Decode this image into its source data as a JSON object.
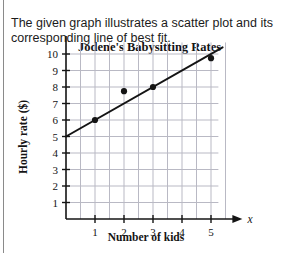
{
  "prompt": {
    "text": "The given graph illustrates a scatter plot and its corresponding line of best fit."
  },
  "chart_data": {
    "type": "scatter",
    "title": "Jodene's Babysitting Rates",
    "xlabel": "Number of kids",
    "ylabel": "Hourly rate ($)",
    "x_axis_variable": "x",
    "y_axis_variable": "y",
    "xlim": [
      0,
      5.6
    ],
    "ylim": [
      0,
      10.7
    ],
    "xticks": [
      1,
      2,
      3,
      4,
      5
    ],
    "yticks": [
      1,
      2,
      3,
      4,
      5,
      6,
      7,
      8,
      9,
      10
    ],
    "xtick_labels": [
      "1",
      "2",
      "3",
      "4",
      "5"
    ],
    "ytick_labels": [
      "1",
      "2",
      "3",
      "4",
      "5",
      "6",
      "7",
      "8",
      "9",
      "10"
    ],
    "grid": true,
    "grid_minor_x": true,
    "legend": "none",
    "points": [
      {
        "x": 1,
        "y": 6
      },
      {
        "x": 2,
        "y": 7.75
      },
      {
        "x": 3,
        "y": 8
      },
      {
        "x": 5,
        "y": 9.75
      }
    ],
    "line_of_best_fit": {
      "label": "line of best fit",
      "x_start": 0,
      "y_start": 5,
      "x_end": 5.4,
      "y_end": 10.4,
      "slope": 1,
      "intercept": 5
    }
  },
  "colors": {
    "ink": "#141414",
    "grid": "#b9b9c4",
    "rule": "#8a8a8a",
    "background": "#ffffff"
  }
}
